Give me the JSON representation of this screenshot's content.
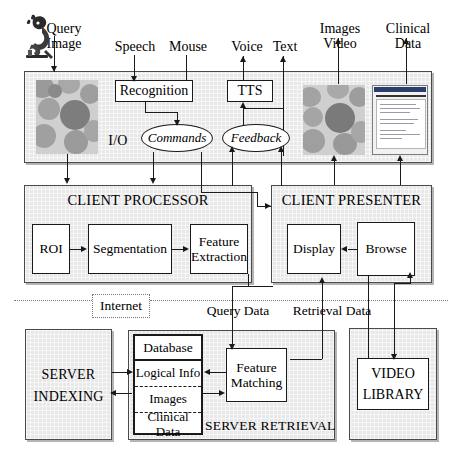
{
  "diagram": {
    "io_layer": {
      "label": "I/O",
      "inputs": [
        {
          "name": "query-image",
          "label_line1": "Query",
          "label_line2": "Image"
        },
        {
          "name": "speech",
          "label_line1": "Speech",
          "label_line2": ""
        },
        {
          "name": "mouse",
          "label_line1": "Mouse",
          "label_line2": ""
        }
      ],
      "outputs": [
        {
          "name": "voice",
          "label_line1": "Voice",
          "label_line2": ""
        },
        {
          "name": "text",
          "label_line1": "Text",
          "label_line2": ""
        },
        {
          "name": "images-video",
          "label_line1": "Images",
          "label_line2": "Video"
        },
        {
          "name": "clinical-data",
          "label_line1": "Clinical",
          "label_line2": "Data"
        }
      ],
      "nodes": [
        {
          "name": "recognition",
          "label": "Recognition"
        },
        {
          "name": "tts",
          "label": "TTS"
        },
        {
          "name": "commands",
          "label": "Commands"
        },
        {
          "name": "feedback",
          "label": "Feedback"
        }
      ]
    },
    "client_processor": {
      "title": "CLIENT PROCESSOR",
      "nodes": [
        {
          "name": "roi",
          "label": "ROI"
        },
        {
          "name": "segmentation",
          "label": "Segmentation"
        },
        {
          "name": "feature-extraction",
          "label_line1": "Feature",
          "label_line2": "Extraction"
        }
      ]
    },
    "client_presenter": {
      "title": "CLIENT PRESENTER",
      "nodes": [
        {
          "name": "display",
          "label": "Display"
        },
        {
          "name": "browse",
          "label": "Browse"
        }
      ]
    },
    "network": {
      "label": "Internet",
      "flow_labels": [
        {
          "name": "query-data",
          "label": "Query Data"
        },
        {
          "name": "retrieval-data",
          "label": "Retrieval Data"
        }
      ]
    },
    "server_indexing": {
      "title_line1": "SERVER",
      "title_line2": "INDEXING"
    },
    "server_retrieval": {
      "title": "SERVER RETRIEVAL",
      "database": {
        "header": "Database",
        "rows": [
          {
            "name": "logical-info",
            "label": "Logical Info"
          },
          {
            "name": "images",
            "label": "Images"
          },
          {
            "name": "clinical-data",
            "label": "Clinical Data"
          }
        ]
      },
      "nodes": [
        {
          "name": "feature-matching",
          "label_line1": "Feature",
          "label_line2": "Matching"
        }
      ]
    },
    "video_library": {
      "title_line1": "VIDEO",
      "title_line2": "LIBRARY"
    }
  },
  "colors": {
    "panel_fill": "#e8e8e8",
    "stroke": "#1a1a1a",
    "panel_stroke": "#4a4a4a",
    "dotted": "#7a7a7a",
    "thumb_bg": "#cfcfcf",
    "doc_titlebar": "#2b3e6b"
  }
}
